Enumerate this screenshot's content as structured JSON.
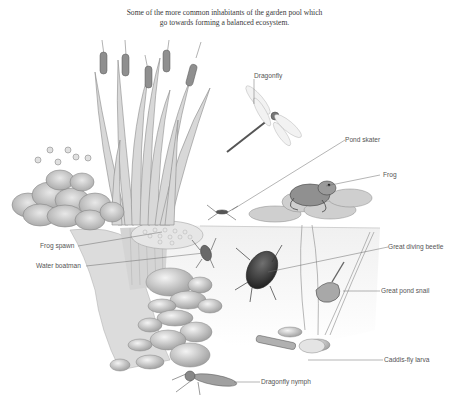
{
  "caption": {
    "line1": "Some of the more common inhabitants of the garden pool which",
    "line2": "go towards forming a balanced ecosystem."
  },
  "labels": {
    "dragonfly": "Dragonfly",
    "pond_skater": "Pond skater",
    "frog": "Frog",
    "frog_spawn": "Frog spawn",
    "water_boatman": "Water boatman",
    "great_diving_beetle": "Great diving beetle",
    "great_pond_snail": "Great pond snail",
    "caddis_fly_larva": "Caddis-fly larva",
    "dragonfly_nymph": "Dragonfly nymph"
  },
  "colors": {
    "ink": "#555555",
    "leader_line": "#6a6a6a",
    "pencil_dark": "#5a5a5a",
    "pencil_mid": "#9a9a9a",
    "pencil_light": "#cfcfcf",
    "water": "#f4f4f4",
    "lily_green": "#b9b9b9"
  }
}
